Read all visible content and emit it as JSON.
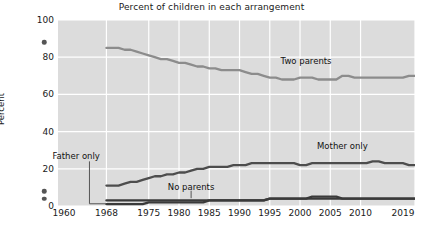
{
  "chart_data": {
    "type": "line",
    "title": "Percent of children in each arrangement",
    "xlabel": "",
    "ylabel": "Percent",
    "ylim": [
      0,
      100
    ],
    "xlim": [
      1960,
      2019
    ],
    "yticks": [
      0,
      20,
      40,
      60,
      80,
      100
    ],
    "ytick_labels": [
      "0",
      "20",
      "40",
      "60",
      "80",
      "100"
    ],
    "xticks": [
      1960,
      1968,
      1975,
      1980,
      1985,
      1990,
      1995,
      2000,
      2005,
      2010,
      2019
    ],
    "xtick_labels": [
      "1960",
      "1968",
      "1975",
      "1980",
      "1985",
      "1990",
      "1995",
      "2000",
      "2005",
      "2010",
      "2019"
    ],
    "grid": true,
    "grid_color": "#ffffff",
    "plot_background": "#dcdcdc",
    "legend_position": "inline-annotations",
    "annotations": [
      {
        "text": "Two parents",
        "x": 2001,
        "y": 78
      },
      {
        "text": "Mother only",
        "x": 2007,
        "y": 32
      },
      {
        "text": "Father only",
        "x": 1963,
        "y": 27
      },
      {
        "text": "No parents",
        "x": 1982,
        "y": 10
      }
    ],
    "isolated_points_1960": [
      {
        "series": "Two parents",
        "x": 1960,
        "y": 88
      },
      {
        "series": "Mother only",
        "x": 1960,
        "y": 8
      },
      {
        "series": "No parents",
        "x": 1960,
        "y": 4
      }
    ],
    "series": [
      {
        "name": "Two parents",
        "color": "#8c8c8c",
        "x": [
          1968,
          1969,
          1970,
          1971,
          1972,
          1973,
          1974,
          1975,
          1976,
          1977,
          1978,
          1979,
          1980,
          1981,
          1982,
          1983,
          1984,
          1985,
          1986,
          1987,
          1988,
          1989,
          1990,
          1991,
          1992,
          1993,
          1994,
          1995,
          1996,
          1997,
          1998,
          1999,
          2000,
          2001,
          2002,
          2003,
          2004,
          2005,
          2006,
          2007,
          2008,
          2009,
          2010,
          2011,
          2012,
          2013,
          2014,
          2015,
          2016,
          2017,
          2018,
          2019
        ],
        "values": [
          85,
          85,
          85,
          84,
          84,
          83,
          82,
          81,
          80,
          79,
          79,
          78,
          77,
          77,
          76,
          75,
          75,
          74,
          74,
          73,
          73,
          73,
          73,
          72,
          71,
          71,
          70,
          69,
          69,
          68,
          68,
          68,
          69,
          69,
          69,
          68,
          68,
          68,
          68,
          70,
          70,
          69,
          69,
          69,
          69,
          69,
          69,
          69,
          69,
          69,
          70,
          70
        ]
      },
      {
        "name": "Mother only",
        "color": "#4d4d4d",
        "x": [
          1968,
          1969,
          1970,
          1971,
          1972,
          1973,
          1974,
          1975,
          1976,
          1977,
          1978,
          1979,
          1980,
          1981,
          1982,
          1983,
          1984,
          1985,
          1986,
          1987,
          1988,
          1989,
          1990,
          1991,
          1992,
          1993,
          1994,
          1995,
          1996,
          1997,
          1998,
          1999,
          2000,
          2001,
          2002,
          2003,
          2004,
          2005,
          2006,
          2007,
          2008,
          2009,
          2010,
          2011,
          2012,
          2013,
          2014,
          2015,
          2016,
          2017,
          2018,
          2019
        ],
        "values": [
          11,
          11,
          11,
          12,
          13,
          13,
          14,
          15,
          16,
          16,
          17,
          17,
          18,
          18,
          19,
          20,
          20,
          21,
          21,
          21,
          21,
          22,
          22,
          22,
          23,
          23,
          23,
          23,
          23,
          23,
          23,
          23,
          22,
          22,
          23,
          23,
          23,
          23,
          23,
          23,
          23,
          23,
          23,
          23,
          24,
          24,
          23,
          23,
          23,
          23,
          22,
          22
        ]
      },
      {
        "name": "Father only",
        "color": "#3a3a3a",
        "x": [
          1968,
          1969,
          1970,
          1971,
          1972,
          1973,
          1974,
          1975,
          1976,
          1977,
          1978,
          1979,
          1980,
          1981,
          1982,
          1983,
          1984,
          1985,
          1986,
          1987,
          1988,
          1989,
          1990,
          1991,
          1992,
          1993,
          1994,
          1995,
          1996,
          1997,
          1998,
          1999,
          2000,
          2001,
          2002,
          2003,
          2004,
          2005,
          2006,
          2007,
          2008,
          2009,
          2010,
          2011,
          2012,
          2013,
          2014,
          2015,
          2016,
          2017,
          2018,
          2019
        ],
        "values": [
          1,
          1,
          1,
          1,
          1,
          1,
          1,
          2,
          2,
          2,
          2,
          2,
          2,
          2,
          2,
          2,
          2,
          3,
          3,
          3,
          3,
          3,
          3,
          3,
          3,
          3,
          3,
          4,
          4,
          4,
          4,
          4,
          4,
          4,
          5,
          5,
          5,
          5,
          5,
          4,
          4,
          4,
          4,
          4,
          4,
          4,
          4,
          4,
          4,
          4,
          4,
          4
        ]
      },
      {
        "name": "No parents",
        "color": "#3a3a3a",
        "x": [
          1968,
          1969,
          1970,
          1971,
          1972,
          1973,
          1974,
          1975,
          1976,
          1977,
          1978,
          1979,
          1980,
          1981,
          1982,
          1983,
          1984,
          1985,
          1986,
          1987,
          1988,
          1989,
          1990,
          1991,
          1992,
          1993,
          1994,
          1995,
          1996,
          1997,
          1998,
          1999,
          2000,
          2001,
          2002,
          2003,
          2004,
          2005,
          2006,
          2007,
          2008,
          2009,
          2010,
          2011,
          2012,
          2013,
          2014,
          2015,
          2016,
          2017,
          2018,
          2019
        ],
        "values": [
          3,
          3,
          3,
          3,
          3,
          3,
          3,
          3,
          3,
          3,
          3,
          3,
          3,
          3,
          3,
          3,
          3,
          3,
          3,
          3,
          3,
          3,
          3,
          3,
          3,
          3,
          3,
          4,
          4,
          4,
          4,
          4,
          4,
          4,
          4,
          4,
          4,
          4,
          4,
          4,
          4,
          4,
          4,
          4,
          4,
          4,
          4,
          4,
          4,
          4,
          4,
          4
        ]
      }
    ]
  }
}
